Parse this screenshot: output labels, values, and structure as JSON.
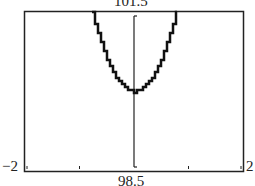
{
  "chart_data": {
    "type": "line",
    "title": "",
    "xlabel": "",
    "ylabel": "",
    "xlim": [
      -2,
      2
    ],
    "ylim": [
      98.5,
      101.5
    ],
    "x_tick_step": 1,
    "grid": false,
    "axis_labels": {
      "ymax": "101.5",
      "ymin": "98.5",
      "xmin": "−2",
      "xmax": "2"
    },
    "series": [
      {
        "name": "parabola",
        "equation_estimate": "y = 100 + 2.5x^2",
        "x": [
          -0.77,
          -0.6,
          -0.4,
          -0.2,
          0,
          0.2,
          0.4,
          0.6,
          0.77
        ],
        "y": [
          101.5,
          100.9,
          100.4,
          100.1,
          100.0,
          100.1,
          100.4,
          100.9,
          101.5
        ]
      }
    ],
    "vertex": [
      0,
      100
    ]
  }
}
